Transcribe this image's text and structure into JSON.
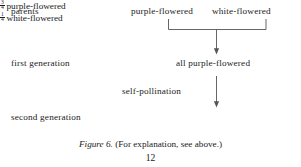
{
  "figure": {
    "stages": [
      {
        "label": "parents"
      },
      {
        "label": "first generation"
      },
      {
        "label": "second generation"
      }
    ],
    "parents": {
      "left": "purple-flowered",
      "right": "white-flowered"
    },
    "first_generation": {
      "result": "all purple-flowered"
    },
    "process": {
      "label": "self-pollination"
    },
    "second_generation": {
      "results": [
        {
          "numerator": "3",
          "denominator": "4",
          "text": "purple-flowered"
        },
        {
          "numerator": "1",
          "denominator": "4",
          "text": "white-flowered"
        }
      ]
    },
    "caption": {
      "figure_label": "Figure 6.",
      "text": "(For explanation, see above.)"
    },
    "page_number": "12",
    "colors": {
      "ink": "#1b1b1b",
      "rule": "#555555",
      "background": "#ffffff"
    }
  }
}
